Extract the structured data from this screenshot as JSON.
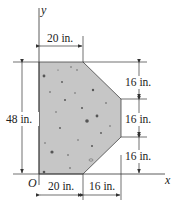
{
  "figure": {
    "type": "composite-area-diagram",
    "axes": {
      "x_label": "x",
      "y_label": "y",
      "origin_label": "O"
    },
    "dimensions": {
      "top_width": "20 in.",
      "bottom_left_width": "20 in.",
      "bottom_right_width": "16 in.",
      "overall_height": "48 in.",
      "right_segment_top": "16 in.",
      "right_segment_middle": "16 in.",
      "right_segment_bottom": "16 in."
    },
    "shape": {
      "vertices_in": [
        [
          0,
          0
        ],
        [
          20,
          0
        ],
        [
          36,
          16
        ],
        [
          36,
          32
        ],
        [
          20,
          48
        ],
        [
          0,
          48
        ]
      ],
      "fill_color": "#c6c6c6",
      "speckle_color": "#555555"
    }
  }
}
